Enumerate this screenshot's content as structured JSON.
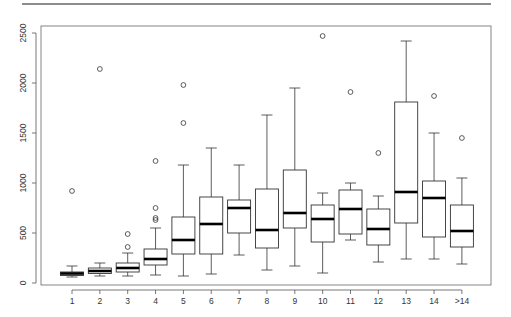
{
  "chart_data": {
    "type": "boxplot",
    "title": "",
    "xlabel": "",
    "ylabel": "",
    "ylim": [
      0,
      2500
    ],
    "yticks": [
      0,
      500,
      1000,
      1500,
      2000,
      2500
    ],
    "ytick_labels": [
      "0",
      "500",
      "1000",
      "1500",
      "2000",
      "2500"
    ],
    "grid": false,
    "legend": null,
    "categories": [
      "1",
      "2",
      "3",
      "4",
      "5",
      "6",
      "7",
      "8",
      "9",
      "10",
      "11",
      "12",
      "13",
      "14",
      ">14"
    ],
    "boxes": [
      {
        "category": "1",
        "whisker_low": 60,
        "q1": 75,
        "median": 95,
        "q3": 110,
        "whisker_high": 170,
        "outliers": [
          920
        ]
      },
      {
        "category": "2",
        "whisker_low": 70,
        "q1": 95,
        "median": 120,
        "q3": 150,
        "whisker_high": 200,
        "outliers": [
          2140
        ]
      },
      {
        "category": "3",
        "whisker_low": 70,
        "q1": 110,
        "median": 150,
        "q3": 200,
        "whisker_high": 300,
        "outliers": [
          360,
          490
        ]
      },
      {
        "category": "4",
        "whisker_low": 80,
        "q1": 180,
        "median": 240,
        "q3": 340,
        "whisker_high": 550,
        "outliers": [
          630,
          650,
          750,
          1220
        ]
      },
      {
        "category": "5",
        "whisker_low": 70,
        "q1": 290,
        "median": 430,
        "q3": 660,
        "whisker_high": 1180,
        "outliers": [
          1600,
          1980
        ]
      },
      {
        "category": "6",
        "whisker_low": 90,
        "q1": 290,
        "median": 590,
        "q3": 860,
        "whisker_high": 1350,
        "outliers": []
      },
      {
        "category": "7",
        "whisker_low": 280,
        "q1": 500,
        "median": 750,
        "q3": 830,
        "whisker_high": 1180,
        "outliers": []
      },
      {
        "category": "8",
        "whisker_low": 130,
        "q1": 350,
        "median": 530,
        "q3": 940,
        "whisker_high": 1680,
        "outliers": []
      },
      {
        "category": "9",
        "whisker_low": 170,
        "q1": 550,
        "median": 700,
        "q3": 1130,
        "whisker_high": 1950,
        "outliers": []
      },
      {
        "category": "10",
        "whisker_low": 100,
        "q1": 410,
        "median": 640,
        "q3": 780,
        "whisker_high": 900,
        "outliers": [
          2470
        ]
      },
      {
        "category": "11",
        "whisker_low": 430,
        "q1": 490,
        "median": 740,
        "q3": 930,
        "whisker_high": 1000,
        "outliers": [
          1910
        ]
      },
      {
        "category": "12",
        "whisker_low": 210,
        "q1": 380,
        "median": 540,
        "q3": 740,
        "whisker_high": 870,
        "outliers": [
          1300
        ]
      },
      {
        "category": "13",
        "whisker_low": 240,
        "q1": 600,
        "median": 910,
        "q3": 1810,
        "whisker_high": 2420,
        "outliers": []
      },
      {
        "category": "14",
        "whisker_low": 240,
        "q1": 460,
        "median": 850,
        "q3": 1020,
        "whisker_high": 1500,
        "outliers": [
          1870
        ]
      },
      {
        "category": ">14",
        "whisker_low": 190,
        "q1": 360,
        "median": 520,
        "q3": 780,
        "whisker_high": 1050,
        "outliers": [
          1450
        ]
      }
    ]
  },
  "style": {
    "box_color": "#333333",
    "median_color": "#000000",
    "axis_color": "#555555",
    "rule_color": "#8c8c8c"
  }
}
